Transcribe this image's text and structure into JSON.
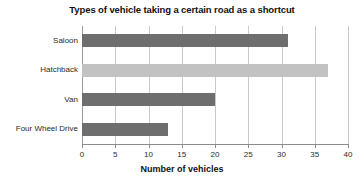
{
  "chart_data": {
    "type": "bar",
    "orientation": "horizontal",
    "title": "Types of vehicle taking a certain road as a shortcut",
    "xlabel": "Number of vehicles",
    "ylabel": "",
    "categories": [
      "Saloon",
      "Hatchback",
      "Van",
      "Four Wheel Drive"
    ],
    "values": [
      31,
      37,
      20,
      13
    ],
    "bar_colors": [
      "#6e6e6e",
      "#c2c2c2",
      "#6e6e6e",
      "#6e6e6e"
    ],
    "xlim": [
      0,
      40
    ],
    "xticks": [
      0,
      5,
      10,
      15,
      20,
      25,
      30,
      35,
      40
    ],
    "xtick_labels": [
      "0",
      "5",
      "10",
      "15",
      "20",
      "25",
      "30",
      "35",
      "40"
    ],
    "grid": "vertical",
    "legend": "none",
    "gridline_color": "#c9c9c9",
    "axis_color": "#8c8c8c",
    "background": "#ffffff"
  }
}
